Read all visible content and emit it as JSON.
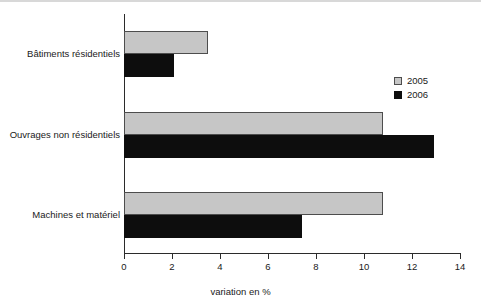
{
  "chart_data": {
    "type": "bar",
    "orientation": "horizontal",
    "title": "",
    "subtitle": "",
    "categories": [
      "Bâtiments résidentiels",
      "Ouvrages non résidentiels",
      "Machines et matériel"
    ],
    "series": [
      {
        "name": "2005",
        "color": "#c6c6c6",
        "values": [
          3.5,
          10.8,
          10.8
        ]
      },
      {
        "name": "2006",
        "color": "#0d0d0d",
        "values": [
          2.1,
          12.9,
          7.4
        ]
      }
    ],
    "xlabel": "variation en %",
    "ylabel": "",
    "xlim": [
      0,
      14
    ],
    "xticks": [
      0,
      2,
      4,
      6,
      8,
      10,
      12,
      14
    ],
    "xtick_labels": [
      "0",
      "2",
      "4",
      "6",
      "8",
      "10",
      "12",
      "14"
    ],
    "grid": false,
    "legend": {
      "position": "top-right",
      "entries": [
        "2005",
        "2006"
      ]
    }
  }
}
